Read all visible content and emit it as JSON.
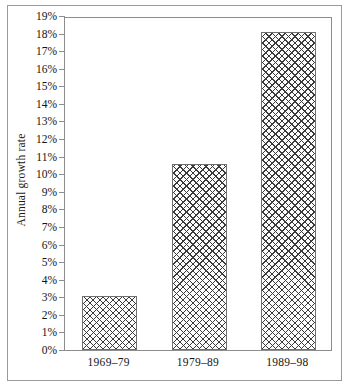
{
  "chart_data": {
    "type": "bar",
    "title": "",
    "subtitle": "",
    "xlabel": "",
    "ylabel": "Annual growth rate",
    "categories": [
      "1969–79",
      "1979–89",
      "1989–98"
    ],
    "values": [
      3.1,
      10.6,
      18.1
    ],
    "value_unit": "%",
    "ylim": [
      0,
      19
    ],
    "ytick_step": 1,
    "ytick_labels": [
      "0%",
      "1%",
      "2%",
      "3%",
      "4%",
      "5%",
      "6%",
      "7%",
      "8%",
      "9%",
      "10%",
      "11%",
      "12%",
      "13%",
      "14%",
      "15%",
      "16%",
      "17%",
      "18%",
      "19%"
    ],
    "ytick_values": [
      0,
      1,
      2,
      3,
      4,
      5,
      6,
      7,
      8,
      9,
      10,
      11,
      12,
      13,
      14,
      15,
      16,
      17,
      18,
      19
    ],
    "grid": false,
    "legend": false,
    "legend_position": "none",
    "bar_fill": "crosshatch",
    "series": [
      {
        "name": "Annual growth rate",
        "values": [
          3.1,
          10.6,
          18.1
        ]
      }
    ],
    "colors": {
      "frame": "#8d8d8d",
      "outer_border": "#9a9a9a",
      "bar_edge": "#6f6f6f",
      "bar_hatch": "#3a3a3a",
      "bar_background": "#fdfdfd",
      "text": "#141414",
      "page_background": "#ffffff"
    }
  }
}
